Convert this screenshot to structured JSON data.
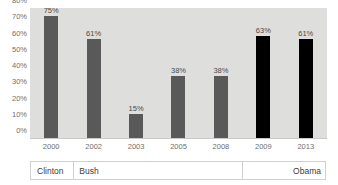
{
  "chart_data": {
    "type": "bar",
    "title": "",
    "xlabel": "",
    "ylabel": "",
    "categories": [
      "2000",
      "2002",
      "2003",
      "2005",
      "2008",
      "2009",
      "2013"
    ],
    "values": [
      75,
      61,
      15,
      38,
      38,
      63,
      61
    ],
    "value_labels": [
      "75%",
      "61%",
      "15%",
      "38%",
      "38%",
      "63%",
      "61%"
    ],
    "bar_colors": [
      "#595959",
      "#595959",
      "#595959",
      "#595959",
      "#595959",
      "#000000",
      "#000000"
    ],
    "ylim": [
      0,
      80
    ],
    "ytick_values": [
      0,
      10,
      20,
      30,
      40,
      50,
      60,
      70,
      80
    ],
    "ytick_labels": [
      "0%",
      "10%",
      "20%",
      "30%",
      "40%",
      "50%",
      "60%",
      "70%",
      "80%"
    ],
    "grid": false,
    "legend": "none",
    "plot_background": "#dededc"
  },
  "era_band": {
    "items": [
      {
        "label": "Clinton",
        "start_index": 0,
        "end_index": 0,
        "align": "left"
      },
      {
        "label": "Bush",
        "start_index": 1,
        "end_index": 4,
        "align": "left"
      },
      {
        "label": "Obama",
        "start_index": 5,
        "end_index": 6,
        "align": "right"
      }
    ]
  }
}
